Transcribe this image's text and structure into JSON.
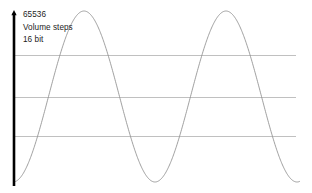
{
  "figure": {
    "width": 312,
    "height": 193,
    "background_color": "#ffffff"
  },
  "annotations": {
    "scale_value": "65536",
    "scale_unit": "Volume steps",
    "bit_depth": "16 bit"
  },
  "axis": {
    "orientation": "vertical",
    "color": "#000000",
    "has_arrowhead": true,
    "x": 14,
    "y_top": 10,
    "y_bottom": 186,
    "width": 2.6
  },
  "gridlines": {
    "color": "#b9b9b9",
    "width": 0.9,
    "x_start": 14,
    "x_end": 296,
    "y_values": [
      55,
      97,
      136
    ]
  },
  "chart_data": {
    "type": "line",
    "title": "",
    "xlabel": "",
    "ylabel": "Volume steps",
    "series": [
      {
        "name": "sine-waveform",
        "color": "#8f8f8f",
        "line_width": 0.85,
        "waveform": "sine",
        "amplitude_px": 85.5,
        "midline_y": 96.5,
        "period_px": 142,
        "phase_x_zero_rising": 48.5,
        "x_start": 14,
        "x_end": 300,
        "peaks_x": [
          84,
          226
        ],
        "troughs_x": [
          155,
          297
        ],
        "peak_y": 11,
        "trough_y": 182
      }
    ],
    "xlim": [
      14,
      300
    ],
    "ylim": [
      11,
      182
    ],
    "grid": true,
    "grid_y": [
      55,
      97,
      136
    ],
    "legend": "none",
    "annotations": [
      "65536",
      "Volume steps",
      "16 bit"
    ]
  }
}
